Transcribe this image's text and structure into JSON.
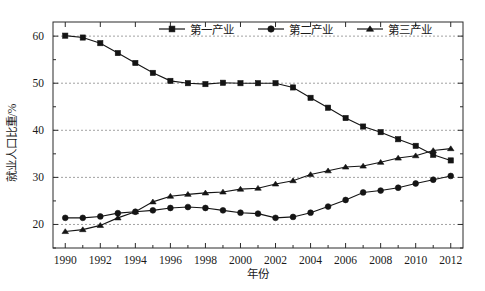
{
  "chart_data": {
    "type": "line",
    "title": "",
    "xlabel": "年份",
    "ylabel": "就业人口比重/%",
    "xlim": [
      1989.3,
      2012.7
    ],
    "ylim": [
      15,
      63
    ],
    "xticks": [
      1990,
      1992,
      1994,
      1996,
      1998,
      2000,
      2002,
      2004,
      2006,
      2008,
      2010,
      2012
    ],
    "xtick_labels": [
      "1990",
      "1992",
      "1994",
      "1996",
      "1998",
      "2000",
      "2002",
      "2004",
      "2006",
      "2008",
      "2010",
      "2012"
    ],
    "yticks": [
      20,
      30,
      40,
      50,
      60
    ],
    "ytick_labels": [
      "20",
      "30",
      "40",
      "50",
      "60"
    ],
    "y_minor_ticks": [
      15,
      25,
      35,
      45,
      55
    ],
    "grid": "horizontal-dashed",
    "legend_position": "top-center",
    "x": [
      1990,
      1991,
      1992,
      1993,
      1994,
      1995,
      1996,
      1997,
      1998,
      1999,
      2000,
      2001,
      2002,
      2003,
      2004,
      2005,
      2006,
      2007,
      2008,
      2009,
      2010,
      2011,
      2012
    ],
    "series": [
      {
        "name": "第一产业",
        "marker": "square",
        "color": "#141414",
        "values": [
          60.1,
          59.7,
          58.5,
          56.4,
          54.3,
          52.2,
          50.5,
          50.0,
          49.8,
          50.1,
          50.0,
          50.0,
          50.0,
          49.1,
          46.9,
          44.8,
          42.6,
          40.8,
          39.6,
          38.1,
          36.7,
          34.8,
          33.6
        ]
      },
      {
        "name": "第二产业",
        "marker": "circle",
        "color": "#141414",
        "values": [
          21.4,
          21.4,
          21.7,
          22.4,
          22.7,
          23.0,
          23.5,
          23.7,
          23.5,
          23.0,
          22.5,
          22.3,
          21.4,
          21.6,
          22.5,
          23.8,
          25.2,
          26.8,
          27.2,
          27.8,
          28.7,
          29.5,
          30.3
        ]
      },
      {
        "name": "第三产业",
        "marker": "triangle",
        "color": "#141414",
        "values": [
          18.5,
          18.9,
          19.8,
          21.4,
          22.7,
          24.8,
          26.0,
          26.4,
          26.7,
          26.9,
          27.5,
          27.7,
          28.6,
          29.3,
          30.6,
          31.4,
          32.2,
          32.4,
          33.2,
          34.1,
          34.6,
          35.7,
          36.1
        ]
      }
    ]
  },
  "legend": {
    "items": [
      {
        "label": "第一产业",
        "marker": "square"
      },
      {
        "label": "第二产业",
        "marker": "circle"
      },
      {
        "label": "第三产业",
        "marker": "triangle"
      }
    ]
  }
}
